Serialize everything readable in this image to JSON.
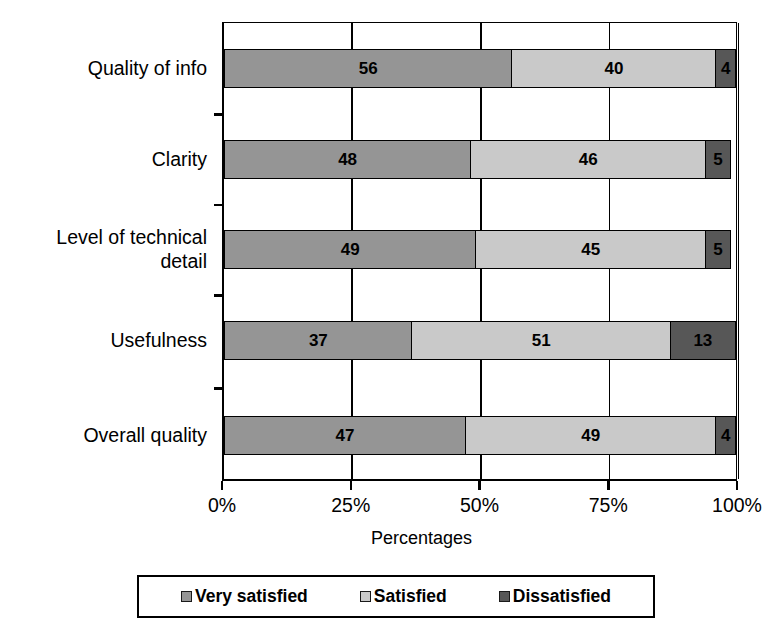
{
  "chart_data": {
    "type": "bar",
    "subtype": "horizontal-stacked-100",
    "title": "",
    "xlabel": "Percentages",
    "ylabel": "",
    "categories": [
      "Quality of info",
      "Clarity",
      "Level of technical\ndetail",
      "Usefulness",
      "Overall quality"
    ],
    "series": [
      {
        "name": "Very satisfied",
        "color": "#959595",
        "values": [
          56,
          48,
          49,
          37,
          47
        ]
      },
      {
        "name": "Satisfied",
        "color": "#c9c9c9",
        "values": [
          40,
          46,
          45,
          51,
          49
        ]
      },
      {
        "name": "Dissatisfied",
        "color": "#575757",
        "values": [
          4,
          5,
          5,
          13,
          4
        ]
      }
    ],
    "xlim": [
      0,
      100
    ],
    "xticks": [
      0,
      25,
      50,
      75,
      100
    ],
    "xticklabels": [
      "0%",
      "25%",
      "50%",
      "75%",
      "100%"
    ],
    "grid": true,
    "legend_position": "bottom",
    "bars": [
      {
        "category": "Quality of info",
        "segments": [
          {
            "series": "Very satisfied",
            "value": 56,
            "label": "56"
          },
          {
            "series": "Satisfied",
            "value": 40,
            "label": "40"
          },
          {
            "series": "Dissatisfied",
            "value": 4,
            "label": "4"
          }
        ]
      },
      {
        "category": "Clarity",
        "segments": [
          {
            "series": "Very satisfied",
            "value": 48,
            "label": "48"
          },
          {
            "series": "Satisfied",
            "value": 46,
            "label": "46"
          },
          {
            "series": "Dissatisfied",
            "value": 5,
            "label": "5"
          }
        ]
      },
      {
        "category": "Level of technical\ndetail",
        "segments": [
          {
            "series": "Very satisfied",
            "value": 49,
            "label": "49"
          },
          {
            "series": "Satisfied",
            "value": 45,
            "label": "45"
          },
          {
            "series": "Dissatisfied",
            "value": 5,
            "label": "5"
          }
        ]
      },
      {
        "category": "Usefulness",
        "segments": [
          {
            "series": "Very satisfied",
            "value": 37,
            "label": "37"
          },
          {
            "series": "Satisfied",
            "value": 51,
            "label": "51"
          },
          {
            "series": "Dissatisfied",
            "value": 13,
            "label": "13"
          }
        ]
      },
      {
        "category": "Overall quality",
        "segments": [
          {
            "series": "Very satisfied",
            "value": 47,
            "label": "47"
          },
          {
            "series": "Satisfied",
            "value": 49,
            "label": "49"
          },
          {
            "series": "Dissatisfied",
            "value": 4,
            "label": "4"
          }
        ]
      }
    ]
  },
  "legend": {
    "items": [
      {
        "label": "Very satisfied",
        "color": "#959595"
      },
      {
        "label": "Satisfied",
        "color": "#c9c9c9"
      },
      {
        "label": "Dissatisfied",
        "color": "#575757"
      }
    ]
  },
  "colors": {
    "very_satisfied": "#959595",
    "satisfied": "#c9c9c9",
    "dissatisfied": "#575757",
    "axis": "#000000",
    "background": "#ffffff"
  }
}
